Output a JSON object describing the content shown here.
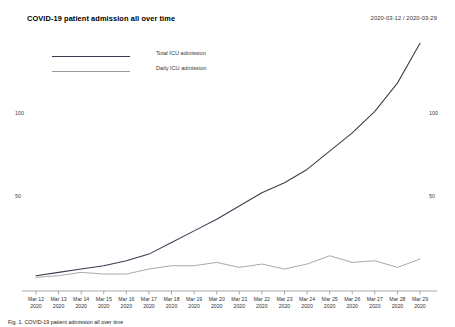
{
  "header": {
    "title": "COVID-19 patient admission all over time",
    "date_range": "2020-03-12 / 2020-03-29"
  },
  "caption": "Fig. 1. COVID-19 patient admission all over time",
  "chart_data": {
    "type": "line",
    "title": "COVID-19 patient admission all over time",
    "xlabel": "",
    "ylabel": "",
    "ylim": [
      0,
      150
    ],
    "grid": false,
    "legend_position": "top-left",
    "yticks": [
      50,
      100
    ],
    "yticks_right": [
      50,
      100
    ],
    "categories": [
      "Mar 12",
      "Mar 13",
      "Mar 14",
      "Mar 15",
      "Mar 16",
      "Mar 17",
      "Mar 17b",
      "Mar 18",
      "Mar 19",
      "Mar 20",
      "Mar 21",
      "Mar 22",
      "Mar 23",
      "Mar 24",
      "Mar 25",
      "Mar 26",
      "Mar 27",
      "Mar 28"
    ],
    "x_tick_labels": [
      {
        "day": "Mar 12",
        "year": "2020"
      },
      {
        "day": "Mar 13",
        "year": "2020"
      },
      {
        "day": "Mar 14",
        "year": "2020"
      },
      {
        "day": "Mar 15",
        "year": "2020"
      },
      {
        "day": "Mar 16",
        "year": "2020"
      },
      {
        "day": "Mar 17",
        "year": "2020"
      },
      {
        "day": "Mar 18",
        "year": "2020"
      },
      {
        "day": "Mar 19",
        "year": "2020"
      },
      {
        "day": "Mar 20",
        "year": "2020"
      },
      {
        "day": "Mar 21",
        "year": "2020"
      },
      {
        "day": "Mar 22",
        "year": "2020"
      },
      {
        "day": "Mar 23",
        "year": "2020"
      },
      {
        "day": "Mar 24",
        "year": "2020"
      },
      {
        "day": "Mar 25",
        "year": "2020"
      },
      {
        "day": "Mar 26",
        "year": "2020"
      },
      {
        "day": "Mar 27",
        "year": "2020"
      },
      {
        "day": "Mar 28",
        "year": "2020"
      },
      {
        "day": "Mar 29",
        "year": "2020"
      }
    ],
    "series": [
      {
        "name": "Total ICU admission",
        "color": "#3b3b4d",
        "values": [
          2,
          4,
          6,
          8,
          11,
          15,
          22,
          29,
          36,
          44,
          52,
          58,
          66,
          77,
          88,
          101,
          118,
          142
        ]
      },
      {
        "name": "Daily ICU admission",
        "color": "#9a9a9a",
        "values": [
          1,
          2,
          4,
          3,
          3,
          6,
          8,
          8,
          10,
          7,
          9,
          6,
          9,
          14,
          10,
          11,
          7,
          12
        ]
      }
    ]
  },
  "legend": [
    {
      "label": "Total ICU admission",
      "color": "#3b3b4d"
    },
    {
      "label": "Daily ICU admission",
      "color": "#9a9a9a"
    }
  ]
}
